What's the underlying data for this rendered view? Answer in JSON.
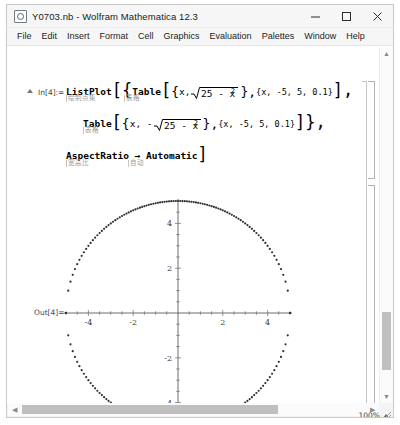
{
  "window": {
    "title": "Y0703.nb - Wolfram Mathematica 12.3",
    "minimize_label": "–",
    "maximize_label": "□",
    "close_label": "✕"
  },
  "menu": {
    "items": [
      "File",
      "Edit",
      "Insert",
      "Format",
      "Cell",
      "Graphics",
      "Evaluation",
      "Palettes",
      "Window",
      "Help"
    ]
  },
  "notebook": {
    "input_label": "In[4]:=",
    "output_label": "Out[4]=",
    "code": {
      "line1": {
        "func": "ListPlot",
        "open1": "[",
        "open2": "{",
        "func2": "Table",
        "open3": "[",
        "open4": "{",
        "arg_x": "x,",
        "sqrt_body": "25 - x",
        "sqrt_exp": "2",
        "close1": "},",
        "range": "{x, -5, 5, 0.1}",
        "close2": "],",
        "ann_listplot": "绘制点集",
        "ann_table": "表格"
      },
      "line2": {
        "func": "Table",
        "open1": "[",
        "open2": "{",
        "arg_x": "x, -",
        "sqrt_body": "25 - x",
        "sqrt_exp": "2",
        "close1": "},",
        "range": "{x, -5, 5, 0.1}",
        "close2": "]},",
        "ann_table": "表格"
      },
      "line3": {
        "option": "AspectRatio → Automatic",
        "close": "]",
        "ann_aspectratio": "宽高比",
        "ann_automatic": "自动"
      }
    }
  },
  "chart_data": {
    "type": "scatter",
    "title": "",
    "xlabel": "",
    "ylabel": "",
    "xlim": [
      -5.3,
      5.3
    ],
    "ylim": [
      -5.3,
      5.3
    ],
    "xticks": [
      -4,
      -2,
      2,
      4
    ],
    "yticks": [
      -4,
      -2,
      2,
      4
    ],
    "xtick_labels": [
      "-4",
      "-2",
      "2",
      "4"
    ],
    "ytick_labels": [
      "-4",
      "-2",
      "2",
      "4"
    ],
    "grid": false,
    "legend": null,
    "axes_style": "crossed-at-origin",
    "marker": "point",
    "marker_size": 1.1,
    "marker_color": "#303030",
    "series": [
      {
        "name": "upper semicircle: {x, sqrt(25 - x^2)}",
        "expression": "sqrt(25 - x^2)",
        "x_start": -5,
        "x_end": 5,
        "x_step": 0.1,
        "point_count": 101
      },
      {
        "name": "lower semicircle: {x, -sqrt(25 - x^2)}",
        "expression": "-sqrt(25 - x^2)",
        "x_start": -5,
        "x_end": 5,
        "x_step": 0.1,
        "point_count": 101
      }
    ]
  },
  "status": {
    "zoom": "100%"
  },
  "icons": {
    "collapse_triangle": "collapse-triangle-icon",
    "scroll_up": "▲",
    "scroll_down": "▼",
    "scroll_left": "◀",
    "scroll_right": "▶"
  }
}
